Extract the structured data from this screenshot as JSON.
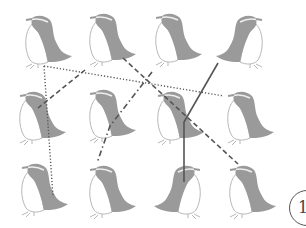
{
  "puzzle": {
    "type": "follow-the-lines",
    "grid": {
      "rows": 3,
      "cols": 4
    },
    "penguins": [
      {
        "row": 1,
        "col": 1,
        "x": 18,
        "y": 10,
        "facing": "left"
      },
      {
        "row": 1,
        "col": 2,
        "x": 82,
        "y": 8,
        "facing": "left"
      },
      {
        "row": 1,
        "col": 3,
        "x": 148,
        "y": 8,
        "facing": "left"
      },
      {
        "row": 1,
        "col": 4,
        "x": 214,
        "y": 10,
        "facing": "right"
      },
      {
        "row": 2,
        "col": 1,
        "x": 12,
        "y": 86,
        "facing": "left"
      },
      {
        "row": 2,
        "col": 2,
        "x": 82,
        "y": 84,
        "facing": "left"
      },
      {
        "row": 2,
        "col": 3,
        "x": 150,
        "y": 86,
        "facing": "left"
      },
      {
        "row": 2,
        "col": 4,
        "x": 220,
        "y": 86,
        "facing": "left"
      },
      {
        "row": 3,
        "col": 1,
        "x": 14,
        "y": 158,
        "facing": "left"
      },
      {
        "row": 3,
        "col": 2,
        "x": 82,
        "y": 160,
        "facing": "left"
      },
      {
        "row": 3,
        "col": 3,
        "x": 152,
        "y": 160,
        "facing": "right"
      },
      {
        "row": 3,
        "col": 4,
        "x": 222,
        "y": 160,
        "facing": "left"
      }
    ],
    "lines": [
      {
        "style": "dotted",
        "points": "44,66 224,96"
      },
      {
        "style": "dotted",
        "points": "44,66 53,197"
      },
      {
        "style": "dashed",
        "points": "123,58 238,164"
      },
      {
        "style": "dashed",
        "points": "85,70 38,108"
      },
      {
        "style": "dash-dot",
        "points": "152,72 110,126 97,163"
      },
      {
        "style": "solid",
        "points": "218,63 184,122 184,182"
      }
    ],
    "colors": {
      "penguin_body": "#9a9a9a",
      "penguin_outline": "#b8b8b8",
      "line": "#555555"
    }
  },
  "badge": {
    "number": "1"
  }
}
